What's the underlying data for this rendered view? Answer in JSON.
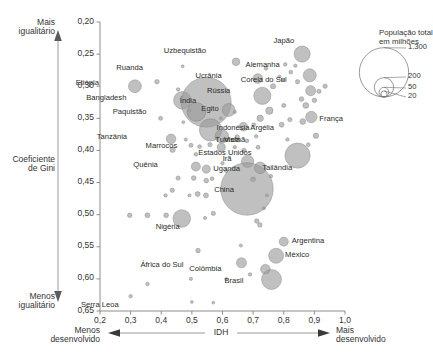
{
  "chart_data": {
    "type": "scatter",
    "title": "",
    "xlabel": "IDH",
    "ylabel": "Coeficiente de Gini",
    "xlim": [
      0.2,
      1.0
    ],
    "ylim": [
      0.2,
      0.65
    ],
    "y_inverted": true,
    "grid": false,
    "xticks": [
      "0,2",
      "0,3",
      "0,4",
      "0,5",
      "0,6",
      "0,7",
      "0,8",
      "0,9",
      "1,0"
    ],
    "xtick_values": [
      0.2,
      0.3,
      0.4,
      0.5,
      0.6,
      0.7,
      0.8,
      0.9,
      1.0
    ],
    "yticks": [
      "0,20",
      "0,25",
      "0,30",
      "0,35",
      "0,40",
      "0,45",
      "0,50",
      "0,55",
      "0,60",
      "0,65"
    ],
    "ytick_values": [
      0.2,
      0.25,
      0.3,
      0.35,
      0.4,
      0.45,
      0.5,
      0.55,
      0.6,
      0.65
    ],
    "axis_annotations": {
      "y_top": "Mais\nigualitário",
      "y_top_line1": "Mais",
      "y_top_line2": "igualitário",
      "y_bottom_line1": "Menos",
      "y_bottom_line2": "igualitário",
      "x_left_line1": "Menos",
      "x_left_line2": "desenvolvido",
      "x_right_line1": "Mais",
      "x_right_line2": "desenvolvido"
    },
    "size_legend": {
      "title_line1": "População total",
      "title_line2": "em milhões",
      "entries": [
        "1.300",
        "200",
        "50",
        "20"
      ],
      "values": [
        1300,
        200,
        50,
        20
      ]
    },
    "bubble_color": "#9a9a9a",
    "points": [
      {
        "name": "Etiópia",
        "x": 0.314,
        "y": 0.3,
        "pop": 80,
        "label": "Etiópia",
        "lx": -36,
        "ly": -3
      },
      {
        "name": "Ruanda",
        "x": 0.386,
        "y": 0.293,
        "pop": 10,
        "label": "Ruanda",
        "lx": -14,
        "ly": -13
      },
      {
        "name": "Bangladesh",
        "x": 0.469,
        "y": 0.322,
        "pop": 150,
        "label": "Bangladesh",
        "lx": -56,
        "ly": -2
      },
      {
        "name": "Índia",
        "x": 0.547,
        "y": 0.325,
        "pop": 1200,
        "label": "Índia",
        "lx": -10,
        "ly": -1
      },
      {
        "name": "Paquistão",
        "x": 0.515,
        "y": 0.34,
        "pop": 170,
        "label": "Paquistão",
        "lx": -50,
        "ly": 1
      },
      {
        "name": "Egito",
        "x": 0.62,
        "y": 0.337,
        "pop": 82,
        "label": "Egito",
        "lx": -10,
        "ly": 0
      },
      {
        "name": "Indonésia",
        "x": 0.561,
        "y": 0.368,
        "pop": 240,
        "label": "Indonésia",
        "lx": 6,
        "ly": -1
      },
      {
        "name": "Vietnã",
        "x": 0.598,
        "y": 0.378,
        "pop": 88,
        "label": "Vietnã",
        "lx": 2,
        "ly": 4
      },
      {
        "name": "Tanzânia",
        "x": 0.432,
        "y": 0.382,
        "pop": 45,
        "label": "Tanzânia",
        "lx": -44,
        "ly": -1
      },
      {
        "name": "Marrocos",
        "x": 0.596,
        "y": 0.395,
        "pop": 32,
        "label": "Marrocos",
        "lx": -44,
        "ly": -1
      },
      {
        "name": "Tunísia",
        "x": 0.67,
        "y": 0.4,
        "pop": 10,
        "label": "Tunísia",
        "lx": -4,
        "ly": -10
      },
      {
        "name": "Quênia",
        "x": 0.513,
        "y": 0.425,
        "pop": 40,
        "label": "Quênia",
        "lx": -38,
        "ly": -1
      },
      {
        "name": "Uganda",
        "x": 0.547,
        "y": 0.429,
        "pop": 33,
        "label": "Uganda",
        "lx": 7,
        "ly": 0
      },
      {
        "name": "Irã",
        "x": 0.682,
        "y": 0.417,
        "pop": 74,
        "label": "Irã",
        "lx": -16,
        "ly": -2
      },
      {
        "name": "Argélia",
        "x": 0.668,
        "y": 0.363,
        "pop": 36,
        "label": "Argélia",
        "lx": 7,
        "ly": 2
      },
      {
        "name": "Rússia",
        "x": 0.73,
        "y": 0.315,
        "pop": 142,
        "label": "Rússia",
        "lx": -32,
        "ly": -4
      },
      {
        "name": "Ucrânia",
        "x": 0.715,
        "y": 0.288,
        "pop": 46,
        "label": "Ucrânia",
        "lx": -36,
        "ly": -2
      },
      {
        "name": "Uzbequistão",
        "x": 0.644,
        "y": 0.262,
        "pop": 28,
        "label": "Uzbequistão",
        "lx": -30,
        "ly": -10
      },
      {
        "name": "Japão",
        "x": 0.86,
        "y": 0.25,
        "pop": 127,
        "label": "Japão",
        "lx": -8,
        "ly": -13
      },
      {
        "name": "Alemanha",
        "x": 0.885,
        "y": 0.283,
        "pop": 82,
        "label": "Alemanha",
        "lx": -30,
        "ly": -10
      },
      {
        "name": "Coreia do Sul",
        "x": 0.888,
        "y": 0.307,
        "pop": 49,
        "label": "Coreia do Sul",
        "lx": -24,
        "ly": -10
      },
      {
        "name": "França",
        "x": 0.89,
        "y": 0.348,
        "pop": 63,
        "label": "França",
        "lx": 8,
        "ly": 2
      },
      {
        "name": "China",
        "x": 0.68,
        "y": 0.46,
        "pop": 1330,
        "label": "China",
        "lx": -13,
        "ly": 2
      },
      {
        "name": "Tailândia",
        "x": 0.723,
        "y": 0.427,
        "pop": 66,
        "label": "Tailândia",
        "lx": 2,
        "ly": 1
      },
      {
        "name": "Estados Unidos",
        "x": 0.845,
        "y": 0.408,
        "pop": 305,
        "label": "Estados Unidos",
        "lx": -46,
        "ly": -2
      },
      {
        "name": "Nigéria",
        "x": 0.467,
        "y": 0.506,
        "pop": 150,
        "label": "Nigéria",
        "lx": -2,
        "ly": 9
      },
      {
        "name": "Argentina",
        "x": 0.8,
        "y": 0.542,
        "pop": 40,
        "label": "Argentina",
        "lx": 8,
        "ly": 0
      },
      {
        "name": "México",
        "x": 0.775,
        "y": 0.564,
        "pop": 108,
        "label": "México",
        "lx": 9,
        "ly": 0
      },
      {
        "name": "Colômbia",
        "x": 0.74,
        "y": 0.585,
        "pop": 45,
        "label": "Colômbia",
        "lx": -44,
        "ly": 0
      },
      {
        "name": "Brasil",
        "x": 0.76,
        "y": 0.601,
        "pop": 192,
        "label": "Brasil",
        "lx": -28,
        "ly": 2
      },
      {
        "name": "África do Sul",
        "x": 0.662,
        "y": 0.575,
        "pop": 49,
        "label": "África do Sul",
        "lx": -58,
        "ly": 3
      },
      {
        "name": "Serra Leoa",
        "x": 0.3,
        "y": 0.627,
        "pop": 6,
        "label": "Serra Leoa",
        "lx": -12,
        "ly": 9
      }
    ],
    "unlabeled_points": [
      {
        "x": 0.398,
        "y": 0.35,
        "pop": 8
      },
      {
        "x": 0.455,
        "y": 0.305,
        "pop": 6
      },
      {
        "x": 0.492,
        "y": 0.338,
        "pop": 5
      },
      {
        "x": 0.437,
        "y": 0.399,
        "pop": 14
      },
      {
        "x": 0.48,
        "y": 0.383,
        "pop": 5
      },
      {
        "x": 0.497,
        "y": 0.392,
        "pop": 8
      },
      {
        "x": 0.525,
        "y": 0.394,
        "pop": 7
      },
      {
        "x": 0.559,
        "y": 0.391,
        "pop": 9
      },
      {
        "x": 0.513,
        "y": 0.406,
        "pop": 7
      },
      {
        "x": 0.506,
        "y": 0.443,
        "pop": 11
      },
      {
        "x": 0.547,
        "y": 0.447,
        "pop": 11
      },
      {
        "x": 0.455,
        "y": 0.443,
        "pop": 9
      },
      {
        "x": 0.566,
        "y": 0.444,
        "pop": 7
      },
      {
        "x": 0.414,
        "y": 0.47,
        "pop": 6
      },
      {
        "x": 0.436,
        "y": 0.462,
        "pop": 9
      },
      {
        "x": 0.492,
        "y": 0.47,
        "pop": 5
      },
      {
        "x": 0.519,
        "y": 0.468,
        "pop": 12
      },
      {
        "x": 0.546,
        "y": 0.47,
        "pop": 12
      },
      {
        "x": 0.297,
        "y": 0.501,
        "pop": 10
      },
      {
        "x": 0.355,
        "y": 0.501,
        "pop": 12
      },
      {
        "x": 0.416,
        "y": 0.501,
        "pop": 11
      },
      {
        "x": 0.543,
        "y": 0.505,
        "pop": 5
      },
      {
        "x": 0.57,
        "y": 0.498,
        "pop": 9
      },
      {
        "x": 0.52,
        "y": 0.556,
        "pop": 10
      },
      {
        "x": 0.355,
        "y": 0.608,
        "pop": 6
      },
      {
        "x": 0.497,
        "y": 0.6,
        "pop": 5
      },
      {
        "x": 0.5,
        "y": 0.636,
        "pop": 4
      },
      {
        "x": 0.57,
        "y": 0.637,
        "pop": 4
      },
      {
        "x": 0.612,
        "y": 0.6,
        "pop": 4
      },
      {
        "x": 0.66,
        "y": 0.548,
        "pop": 5
      },
      {
        "x": 0.69,
        "y": 0.593,
        "pop": 6
      },
      {
        "x": 0.712,
        "y": 0.51,
        "pop": 10
      },
      {
        "x": 0.722,
        "y": 0.516,
        "pop": 10
      },
      {
        "x": 0.64,
        "y": 0.34,
        "pop": 5
      },
      {
        "x": 0.648,
        "y": 0.379,
        "pop": 10
      },
      {
        "x": 0.64,
        "y": 0.395,
        "pop": 6
      },
      {
        "x": 0.68,
        "y": 0.385,
        "pop": 7
      },
      {
        "x": 0.702,
        "y": 0.36,
        "pop": 7
      },
      {
        "x": 0.71,
        "y": 0.378,
        "pop": 6
      },
      {
        "x": 0.723,
        "y": 0.35,
        "pop": 20
      },
      {
        "x": 0.753,
        "y": 0.338,
        "pop": 26
      },
      {
        "x": 0.765,
        "y": 0.3,
        "pop": 13
      },
      {
        "x": 0.742,
        "y": 0.272,
        "pop": 7
      },
      {
        "x": 0.786,
        "y": 0.285,
        "pop": 5
      },
      {
        "x": 0.797,
        "y": 0.29,
        "pop": 6
      },
      {
        "x": 0.805,
        "y": 0.266,
        "pop": 6
      },
      {
        "x": 0.823,
        "y": 0.278,
        "pop": 7
      },
      {
        "x": 0.838,
        "y": 0.268,
        "pop": 6
      },
      {
        "x": 0.845,
        "y": 0.293,
        "pop": 9
      },
      {
        "x": 0.858,
        "y": 0.32,
        "pop": 11
      },
      {
        "x": 0.872,
        "y": 0.33,
        "pop": 16
      },
      {
        "x": 0.9,
        "y": 0.322,
        "pop": 10
      },
      {
        "x": 0.915,
        "y": 0.308,
        "pop": 9
      },
      {
        "x": 0.935,
        "y": 0.3,
        "pop": 9
      },
      {
        "x": 0.862,
        "y": 0.355,
        "pop": 16
      },
      {
        "x": 0.82,
        "y": 0.352,
        "pop": 9
      },
      {
        "x": 0.8,
        "y": 0.33,
        "pop": 8
      },
      {
        "x": 0.793,
        "y": 0.36,
        "pop": 12
      },
      {
        "x": 0.812,
        "y": 0.383,
        "pop": 6
      },
      {
        "x": 0.88,
        "y": 0.391,
        "pop": 7
      },
      {
        "x": 0.905,
        "y": 0.377,
        "pop": 14
      },
      {
        "x": 0.758,
        "y": 0.44,
        "pop": 6
      },
      {
        "x": 0.716,
        "y": 0.395,
        "pop": 8
      },
      {
        "x": 0.7,
        "y": 0.445,
        "pop": 12
      },
      {
        "x": 0.745,
        "y": 0.47,
        "pop": 5
      },
      {
        "x": 0.735,
        "y": 0.49,
        "pop": 5
      },
      {
        "x": 0.6,
        "y": 0.42,
        "pop": 6
      },
      {
        "x": 0.612,
        "y": 0.432,
        "pop": 5
      },
      {
        "x": 0.595,
        "y": 0.35,
        "pop": 5
      },
      {
        "x": 0.472,
        "y": 0.356,
        "pop": 4
      },
      {
        "x": 0.47,
        "y": 0.269,
        "pop": 4
      }
    ]
  }
}
